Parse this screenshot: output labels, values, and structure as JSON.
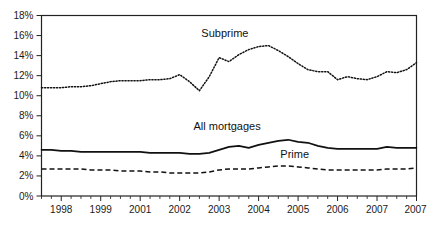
{
  "chart_data": {
    "type": "line",
    "title": "",
    "subtitle": "",
    "xlabel": "",
    "ylabel": "",
    "ylim": [
      0,
      18
    ],
    "ytick_labels": [
      "0%",
      "2%",
      "4%",
      "6%",
      "8%",
      "10%",
      "12%",
      "14%",
      "16%",
      "18%"
    ],
    "ytick_values": [
      0,
      2,
      4,
      6,
      8,
      10,
      12,
      14,
      16,
      18
    ],
    "xtick_labels": [
      "1998",
      "1999",
      "2001",
      "2002",
      "2003",
      "2004",
      "2005",
      "2006",
      "2007"
    ],
    "xtick_values": [
      1998,
      1999,
      2000,
      2001,
      2002,
      2003,
      2004,
      2005,
      2006
    ],
    "xlim": [
      1997.5,
      2007.0
    ],
    "grid": false,
    "legend_position": "inline-annotations",
    "minor_ticks_per_interval": 4,
    "x": [
      1997.5,
      1997.75,
      1998.0,
      1998.25,
      1998.5,
      1998.75,
      1999.0,
      1999.25,
      1999.5,
      1999.75,
      2000.0,
      2000.25,
      2000.5,
      2000.75,
      2001.0,
      2001.25,
      2001.5,
      2001.75,
      2002.0,
      2002.25,
      2002.5,
      2002.75,
      2003.0,
      2003.25,
      2003.5,
      2003.75,
      2004.0,
      2004.25,
      2004.5,
      2004.75,
      2005.0,
      2005.25,
      2005.5,
      2005.75,
      2006.0,
      2006.25,
      2006.5,
      2006.75,
      2007.0
    ],
    "series": [
      {
        "name": "Subprime",
        "style": "dotted",
        "color": "#111111",
        "label_x": 2001.55,
        "label_y": 15.9,
        "values": [
          10.8,
          10.8,
          10.8,
          10.9,
          10.9,
          11.0,
          11.2,
          11.4,
          11.5,
          11.5,
          11.5,
          11.6,
          11.6,
          11.7,
          12.1,
          11.4,
          10.5,
          11.9,
          13.8,
          13.4,
          14.1,
          14.6,
          14.9,
          15.0,
          14.5,
          13.9,
          13.2,
          12.6,
          12.4,
          12.4,
          11.6,
          11.9,
          11.7,
          11.6,
          11.9,
          12.4,
          12.3,
          12.6,
          13.3
        ]
      },
      {
        "name": "All mortgages",
        "style": "solid",
        "color": "#111111",
        "label_x": 2001.35,
        "label_y": 6.6,
        "values": [
          4.6,
          4.6,
          4.5,
          4.5,
          4.4,
          4.4,
          4.4,
          4.4,
          4.4,
          4.4,
          4.4,
          4.3,
          4.3,
          4.3,
          4.3,
          4.2,
          4.2,
          4.3,
          4.6,
          4.9,
          5.0,
          4.8,
          5.1,
          5.3,
          5.5,
          5.6,
          5.4,
          5.3,
          5.0,
          4.8,
          4.7,
          4.7,
          4.7,
          4.7,
          4.7,
          4.9,
          4.8,
          4.8,
          4.8
        ]
      },
      {
        "name": "Prime",
        "style": "dashed",
        "color": "#111111",
        "label_x": 2003.55,
        "label_y": 3.75,
        "values": [
          2.7,
          2.7,
          2.7,
          2.7,
          2.7,
          2.6,
          2.6,
          2.6,
          2.5,
          2.5,
          2.5,
          2.4,
          2.4,
          2.3,
          2.3,
          2.3,
          2.3,
          2.4,
          2.6,
          2.7,
          2.7,
          2.7,
          2.8,
          2.9,
          3.0,
          3.0,
          2.9,
          2.8,
          2.7,
          2.6,
          2.6,
          2.6,
          2.6,
          2.6,
          2.6,
          2.7,
          2.7,
          2.7,
          2.8
        ]
      }
    ]
  },
  "extended_tail": {
    "note_subprime_tail": [
      13.3,
      14.0,
      14.6,
      15.1
    ],
    "note_all_tail": [
      4.9,
      5.1,
      5.3,
      5.4
    ],
    "note_prime_tail": [
      2.8,
      2.9,
      2.95,
      3.0
    ]
  }
}
